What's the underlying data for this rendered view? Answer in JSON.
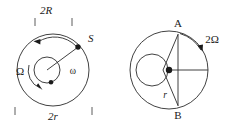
{
  "figure": {
    "background_color": "#ffffff",
    "ink_color": "#1a1a1a",
    "panels": [
      {
        "id": "left-panel",
        "name": "orbiting-satellite-diagram",
        "labels": {
          "top_dimension": "2R",
          "bottom_dimension": "2r",
          "satellite_point": "S",
          "outer_angular_velocity": "Ω",
          "inner_angular_velocity": "ω"
        },
        "geometry": {
          "outer_circle": {
            "cx": 53,
            "cy": 70,
            "r": 36
          },
          "inner_circle": {
            "cx": 47,
            "cy": 70,
            "r": 13
          },
          "satellite_dot": {
            "x": 78,
            "y": 47
          },
          "inner_dot": {
            "x": 51,
            "y": 82
          },
          "radius_line": {
            "x1": 47,
            "y1": 70,
            "x2": 78,
            "y2": 47
          }
        },
        "arrows": [
          {
            "name": "outer-ccw-arrow",
            "direction": "counterclockwise"
          },
          {
            "name": "inner-cw-arrow",
            "direction": "clockwise"
          }
        ],
        "tick_marks": {
          "top": [
            "left-tick",
            "right-tick"
          ],
          "bottom": [
            "left-tick",
            "right-tick"
          ]
        }
      },
      {
        "id": "right-panel",
        "name": "chord-rotation-diagram",
        "labels": {
          "point_top": "A",
          "point_bottom": "B",
          "angular_velocity": "2Ω",
          "radius": "r"
        },
        "geometry": {
          "outer_circle": {
            "cx": 169,
            "cy": 70,
            "r": 39
          },
          "inner_circle": {
            "cx": 152,
            "cy": 70,
            "r": 16
          },
          "center_dot": {
            "x": 169,
            "y": 70
          },
          "chord_top": {
            "x": 178,
            "y": 34
          },
          "chord_bottom": {
            "x": 178,
            "y": 106
          },
          "horizontal_line": {
            "x1": 169,
            "y1": 70,
            "x2": 208,
            "y2": 70
          }
        },
        "arrows": [
          {
            "name": "outer-cw-arrow",
            "direction": "clockwise"
          }
        ]
      }
    ]
  }
}
